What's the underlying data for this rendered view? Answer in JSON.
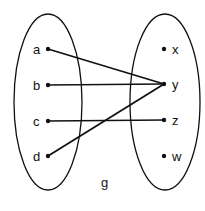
{
  "diagram": {
    "function_label": "g",
    "domain_set": [
      {
        "label": "a",
        "x": 48,
        "y": 49
      },
      {
        "label": "b",
        "x": 48,
        "y": 85
      },
      {
        "label": "c",
        "x": 48,
        "y": 121
      },
      {
        "label": "d",
        "x": 48,
        "y": 156
      }
    ],
    "codomain_set": [
      {
        "label": "x",
        "x": 164,
        "y": 49
      },
      {
        "label": "y",
        "x": 164,
        "y": 84
      },
      {
        "label": "z",
        "x": 164,
        "y": 120
      },
      {
        "label": "w",
        "x": 164,
        "y": 156
      }
    ],
    "mappings": [
      {
        "from": "a",
        "to": "y"
      },
      {
        "from": "b",
        "to": "y"
      },
      {
        "from": "c",
        "to": "z"
      },
      {
        "from": "d",
        "to": "y"
      }
    ],
    "colors": {
      "stroke": "#111111",
      "background": "#ffffff"
    }
  }
}
